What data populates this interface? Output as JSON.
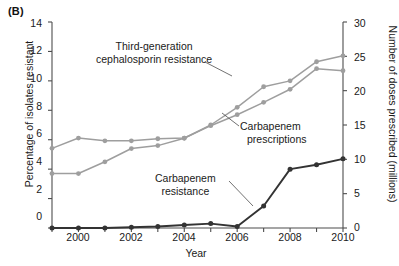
{
  "panel": {
    "label": "(B)"
  },
  "axes": {
    "x": {
      "title": "Year",
      "ticks": [
        1999,
        2000,
        2001,
        2002,
        2003,
        2004,
        2005,
        2006,
        2007,
        2008,
        2009,
        2010
      ],
      "labelled_ticks": [
        "2000",
        "2002",
        "2004",
        "2006",
        "2008",
        "2010"
      ],
      "range": [
        1999,
        2010
      ]
    },
    "y_left": {
      "title": "Percentage of isolates resistant",
      "ticks": [
        "0",
        "2",
        "4",
        "6",
        "8",
        "10",
        "12",
        "14"
      ],
      "range": [
        0,
        14
      ]
    },
    "y_right": {
      "title": "Number of doses prescribed (millions)",
      "ticks": [
        "0",
        "5",
        "10",
        "15",
        "20",
        "25",
        "30"
      ],
      "range": [
        0,
        30
      ]
    }
  },
  "annotations": [
    {
      "id": "ceph",
      "line1": "Third-generation",
      "line2": "cephalosporin resistance"
    },
    {
      "id": "carb-presc",
      "line1": "Carbapenem",
      "line2": "prescriptions"
    },
    {
      "id": "carb-res",
      "line1": "Carbapenem",
      "line2": "resistance"
    }
  ],
  "colors": {
    "light_series": "#9e9e9e",
    "dark_series": "#333333",
    "axis": "#4d4d4d",
    "text": "#1a1a1a",
    "background": "#ffffff"
  },
  "chart_data": {
    "type": "line",
    "title": "(B)",
    "xlabel": "Year",
    "ylabel": "Percentage of isolates resistant",
    "y2label": "Number of doses prescribed (millions)",
    "xlim": [
      1999,
      2010
    ],
    "ylim": [
      0,
      14
    ],
    "y2lim": [
      0,
      30
    ],
    "grid": false,
    "legend": "annotations-inline",
    "x": [
      1999,
      2000,
      2001,
      2002,
      2003,
      2004,
      2005,
      2006,
      2007,
      2008,
      2009,
      2010
    ],
    "series": [
      {
        "name": "Third-generation cephalosporin resistance",
        "axis": "left",
        "unit": "percent",
        "color": "#9e9e9e",
        "marker": "circle",
        "values": [
          3.7,
          3.7,
          4.5,
          5.4,
          5.6,
          6.1,
          7.0,
          8.2,
          9.6,
          10.0,
          11.3,
          11.7
        ]
      },
      {
        "name": "Carbapenem prescriptions",
        "axis": "right",
        "unit": "millions of doses",
        "color": "#9e9e9e",
        "marker": "circle",
        "values": [
          11.6,
          13.1,
          12.7,
          12.7,
          13.0,
          13.1,
          14.9,
          16.5,
          18.3,
          20.2,
          23.2,
          22.9
        ]
      },
      {
        "name": "Carbapenem resistance",
        "axis": "left",
        "unit": "percent",
        "color": "#333333",
        "marker": "circle",
        "values": [
          0.0,
          0.0,
          0.0,
          0.05,
          0.1,
          0.2,
          0.3,
          0.1,
          1.5,
          4.0,
          4.3,
          4.7
        ]
      }
    ]
  }
}
